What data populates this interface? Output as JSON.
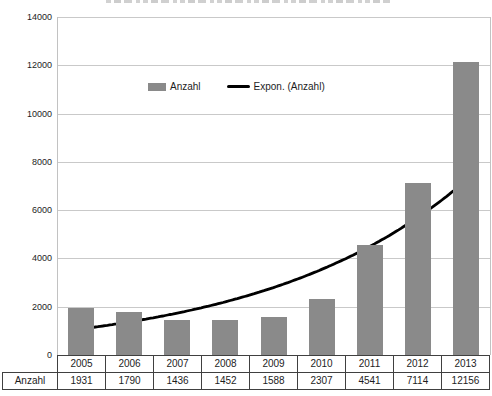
{
  "chart_data": {
    "type": "bar",
    "title": "",
    "xlabel": "",
    "ylabel": "",
    "categories": [
      "2005",
      "2006",
      "2007",
      "2008",
      "2009",
      "2010",
      "2011",
      "2012",
      "2013"
    ],
    "series": [
      {
        "name": "Anzahl",
        "values": [
          1931,
          1790,
          1436,
          1452,
          1588,
          2307,
          4541,
          7114,
          12156
        ],
        "color": "#8a8a8a"
      }
    ],
    "trendline": {
      "name": "Expon. (Anzahl)",
      "type": "exponential",
      "color": "#000000",
      "drawn_behind_bars": true
    },
    "ylim": [
      0,
      14000
    ],
    "yticks": [
      0,
      2000,
      4000,
      6000,
      8000,
      10000,
      12000,
      14000
    ],
    "grid": true,
    "legend_position": "inside-top"
  },
  "data_table": {
    "row_header": "Anzahl",
    "columns": [
      "2005",
      "2006",
      "2007",
      "2008",
      "2009",
      "2010",
      "2011",
      "2012",
      "2013"
    ],
    "values": [
      "1931",
      "1790",
      "1436",
      "1452",
      "1588",
      "2307",
      "4541",
      "7114",
      "12156"
    ]
  },
  "colors": {
    "bar": "#8a8a8a",
    "trendline": "#000000",
    "gridline": "#c9c9c9",
    "plot_border": "#c2c2c2",
    "table_border": "#404040",
    "text": "#1d1d1d",
    "background": "#ffffff"
  }
}
